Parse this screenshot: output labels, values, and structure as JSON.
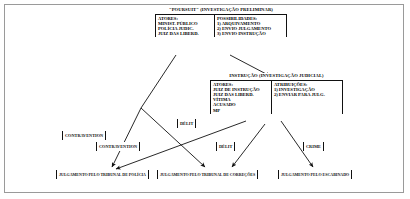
{
  "diagram": {
    "title_visible": false,
    "background": "#ffffff",
    "border_color": "#9a9a9a",
    "line_color": "#111111"
  },
  "panels": [
    {
      "id": "poursuit",
      "header": "\"POURSUIT\" (INVESTIGAÇÃO PRELIMINAR)",
      "left_column": {
        "heading": "ATORES:",
        "items": [
          "MINIST. PÚBLICO",
          "POLÍCIA JUDIC.",
          "JUIZ DAS LIBERD."
        ]
      },
      "right_column": {
        "heading": "POSSIBILIDADES:",
        "items": [
          "1) ARQUIVAMENTO",
          "2) ENVIO JULGAMENTO",
          "3) ENVIO INSTRUÇÃO"
        ]
      }
    },
    {
      "id": "instrucao",
      "header": "INSTRUÇÃO (INVESTIGAÇÃO JUDICIAL)",
      "left_column": {
        "heading": "ATORES:",
        "items": [
          "JUIZ DE INSTRUÇÃO",
          "JUIZ DAS LIBERD.",
          "VÍTIMA",
          "ACUSADO",
          "MP"
        ]
      },
      "right_column": {
        "heading": "ATRIBUIÇÕES:",
        "items": [
          "1) INVESTIGAÇÃO",
          "2) ENVIAR PARA JULG."
        ]
      }
    }
  ],
  "offense_tags": [
    {
      "id": "contravention-1",
      "label": "CONTRAVENTION"
    },
    {
      "id": "contravention-2",
      "label": "CONTRAVENTION"
    },
    {
      "id": "delit-1",
      "label": "DÉLIT"
    },
    {
      "id": "delit-2",
      "label": "DÉLIT"
    },
    {
      "id": "crime",
      "label": "CRIME"
    }
  ],
  "outcome_tags": [
    {
      "id": "trib-policia",
      "label": "JULGAMENTO PELO TRIBUNAL DE POLÍCIA"
    },
    {
      "id": "trib-correcoes",
      "label": "JULGAMENTO PELO TRIBUNAL DE CORREÇÕES"
    },
    {
      "id": "escabinado",
      "label": "JULGAMENTO PELO ESCABINADO"
    }
  ],
  "flows": [
    {
      "from": "poursuit",
      "to": "trib-policia",
      "via": "contravention-1"
    },
    {
      "from": "poursuit",
      "to": "trib-correcoes",
      "via": "delit-1"
    },
    {
      "from": "poursuit",
      "to": "instrucao",
      "via": "envio-instrucao"
    },
    {
      "from": "instrucao",
      "to": "trib-policia",
      "via": "contravention-2"
    },
    {
      "from": "instrucao",
      "to": "trib-correcoes",
      "via": "delit-2"
    },
    {
      "from": "instrucao",
      "to": "escabinado",
      "via": "crime"
    }
  ]
}
